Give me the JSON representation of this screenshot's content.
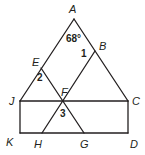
{
  "diagram": {
    "points": {
      "A": {
        "label": "A",
        "x": 74,
        "y": 19,
        "lx": 69,
        "ly": 13
      },
      "B": {
        "label": "B",
        "x": 95,
        "y": 51,
        "lx": 99,
        "ly": 50
      },
      "C": {
        "label": "C",
        "x": 128,
        "y": 101,
        "lx": 132,
        "ly": 105
      },
      "D": {
        "label": "D",
        "x": 128,
        "y": 133,
        "lx": 130,
        "ly": 148
      },
      "E": {
        "label": "E",
        "x": 41,
        "y": 68,
        "lx": 32,
        "ly": 66
      },
      "F": {
        "label": "F",
        "x": 63,
        "y": 101,
        "lx": 61,
        "ly": 96
      },
      "G": {
        "label": "G",
        "x": 84,
        "y": 133,
        "lx": 80,
        "ly": 148
      },
      "H": {
        "label": "H",
        "x": 42,
        "y": 133,
        "lx": 34,
        "ly": 148
      },
      "J": {
        "label": "J",
        "x": 20,
        "y": 101,
        "lx": 9,
        "ly": 105
      },
      "K": {
        "label": "K",
        "x": 20,
        "y": 133,
        "lx": 6,
        "ly": 146
      }
    },
    "angle_labels": [
      {
        "text": "68°",
        "x": 66,
        "y": 42
      },
      {
        "text": "1",
        "x": 81,
        "y": 57
      },
      {
        "text": "2",
        "x": 37,
        "y": 81
      },
      {
        "text": "3",
        "x": 60,
        "y": 117
      }
    ],
    "segments": [
      [
        "A",
        "J"
      ],
      [
        "A",
        "C"
      ],
      [
        "J",
        "C"
      ],
      [
        "K",
        "D"
      ],
      [
        "J",
        "K"
      ],
      [
        "C",
        "D"
      ],
      [
        "E",
        "G"
      ],
      [
        "B",
        "H"
      ]
    ]
  }
}
